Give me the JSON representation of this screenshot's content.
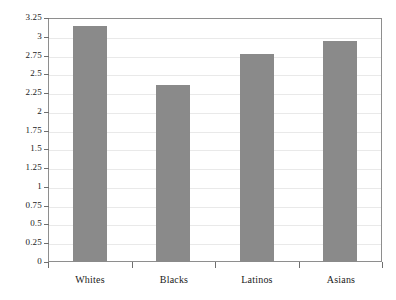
{
  "chart_data": {
    "type": "bar",
    "title": "",
    "subtitle": "",
    "xlabel": "",
    "ylabel": "",
    "categories": [
      "Whites",
      "Blacks",
      "Latinos",
      "Asians"
    ],
    "values": [
      3.14,
      2.36,
      2.77,
      2.94
    ],
    "series": [
      {
        "name": "",
        "values": [
          3.14,
          2.36,
          2.77,
          2.94
        ]
      }
    ],
    "ylim": [
      0,
      3.25
    ],
    "ytick_labels": [
      "3.25",
      "3",
      "2.75",
      "2.5",
      "2.25",
      "2",
      "1.75",
      "1.5",
      "1.25",
      "1",
      "0.75",
      "0.5",
      "0.25",
      "0"
    ],
    "ytick_values": [
      3.25,
      3,
      2.75,
      2.5,
      2.25,
      2,
      1.75,
      1.5,
      1.25,
      1,
      0.75,
      0.5,
      0.25,
      0
    ],
    "ytick_step": 0.25,
    "grid": true,
    "grid_axis": "y",
    "legend": false,
    "legend_position": "none",
    "bar_color": "#8a8a8a",
    "grid_color": "#e9e9e9",
    "axis_color": "#8e8e8e",
    "background_color": "#ffffff",
    "text_color": "#1a1a1a"
  }
}
